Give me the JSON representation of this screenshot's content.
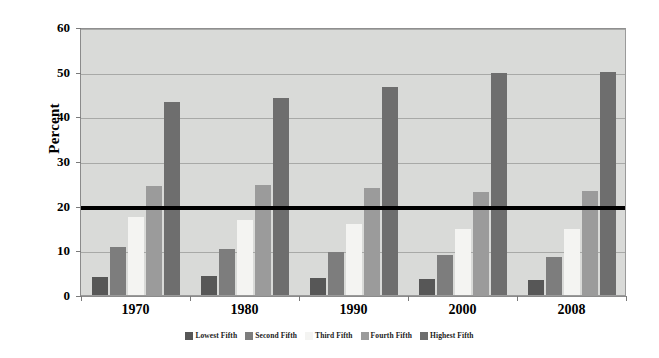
{
  "chart_data": {
    "type": "bar",
    "title": "",
    "xlabel": "",
    "ylabel": "Percent",
    "categories": [
      "1970",
      "1980",
      "1990",
      "2000",
      "2008"
    ],
    "ylim": [
      0,
      60
    ],
    "yticks": [
      0,
      10,
      20,
      30,
      40,
      50,
      60
    ],
    "grid": true,
    "legend_position": "bottom",
    "annotations": [
      {
        "name": "equal-share-line",
        "type": "horizontal-line",
        "value": 20,
        "color": "#000000"
      }
    ],
    "series": [
      {
        "name": "Lowest Fifth",
        "color": "#575757",
        "values": [
          4.1,
          4.2,
          3.8,
          3.6,
          3.4
        ]
      },
      {
        "name": "Second Fifth",
        "color": "#7d7d7d",
        "values": [
          10.8,
          10.2,
          9.6,
          8.9,
          8.6
        ]
      },
      {
        "name": "Third Fifth",
        "color": "#f4f4f2",
        "values": [
          17.4,
          16.8,
          15.9,
          14.8,
          14.7
        ]
      },
      {
        "name": "Fourth Fifth",
        "color": "#9b9b9b",
        "values": [
          24.5,
          24.7,
          24.0,
          23.0,
          23.3
        ]
      },
      {
        "name": "Highest Fifth",
        "color": "#6e6e6e",
        "values": [
          43.3,
          44.1,
          46.6,
          49.8,
          50.0
        ]
      }
    ]
  },
  "axis": {
    "y_title": "Percent",
    "y_tick_labels": [
      "0",
      "10",
      "20",
      "30",
      "40",
      "50",
      "60"
    ],
    "x_tick_labels": [
      "1970",
      "1980",
      "1990",
      "2000",
      "2008"
    ]
  },
  "legend": {
    "items": [
      {
        "label": "Lowest Fifth",
        "color": "#575757"
      },
      {
        "label": "Second Fifth",
        "color": "#7d7d7d"
      },
      {
        "label": "Third Fifth",
        "color": "#f4f4f2"
      },
      {
        "label": "Fourth Fifth",
        "color": "#9b9b9b"
      },
      {
        "label": "Highest Fifth",
        "color": "#6e6e6e"
      }
    ]
  },
  "colors": {
    "plot_background": "#d9dad8",
    "gridline": "#a8a9a7",
    "axis_line": "#8b8b8b",
    "threshold_line": "#000000",
    "page_background": "#ffffff"
  }
}
